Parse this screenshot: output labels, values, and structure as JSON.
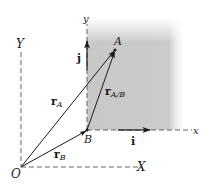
{
  "diagram": {
    "type": "vector-diagram",
    "colors": {
      "ink": "#1a1a1a",
      "shade": "#c8c8c8",
      "background": "#ffffff"
    },
    "points": {
      "O": {
        "label": "O"
      },
      "A": {
        "label": "A"
      },
      "B": {
        "label": "B"
      }
    },
    "axes": {
      "fixed_X": {
        "label": "X"
      },
      "fixed_Y": {
        "label": "Y"
      },
      "moving_x": {
        "label": "x"
      },
      "moving_y": {
        "label": "y"
      }
    },
    "unit_vectors": {
      "i": {
        "label": "i"
      },
      "j": {
        "label": "j"
      }
    },
    "vectors": {
      "r_A": {
        "main": "r",
        "sub": "A"
      },
      "r_B": {
        "main": "r",
        "sub": "B"
      },
      "r_AB": {
        "main": "r",
        "sub": "A/B"
      }
    }
  }
}
